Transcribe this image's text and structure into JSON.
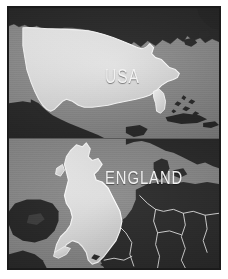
{
  "figure": {
    "name": "country-size-comparison",
    "background_color": "#ffffff",
    "frame_color": "#1b1b1b",
    "ocean_color": "#8d8d8d",
    "land_color": "#272727",
    "highlight_color": "#e4e4e4",
    "border_line_color": "#d9d9d9",
    "label_color": "#f2f2f2"
  },
  "panels": [
    {
      "id": "usa-panel",
      "label": "USA",
      "region": "North America",
      "highlighted_country": "United States",
      "dark_landmasses": [
        "Canada",
        "Mexico",
        "Greenland",
        "Cuba",
        "Bahamas",
        "Caribbean Islands"
      ],
      "water": "Atlantic Ocean, Pacific Ocean, Gulf of Mexico"
    },
    {
      "id": "england-panel",
      "label": "ENGLAND",
      "region": "Western Europe",
      "highlighted_country": "Great Britain",
      "dark_landmasses": [
        "Ireland",
        "France",
        "Belgium",
        "Netherlands",
        "Germany",
        "Denmark",
        "Norway",
        "Spain"
      ],
      "water": "North Sea, English Channel, Atlantic Ocean"
    }
  ]
}
